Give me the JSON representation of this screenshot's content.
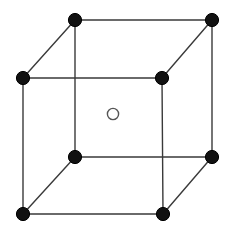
{
  "figure": {
    "canvas": {
      "width": 229,
      "height": 231,
      "background": "#ffffff"
    },
    "style": {
      "edge_color": "#3a3a3a",
      "edge_width": 1.4,
      "corner_atom_fill": "#111111",
      "corner_atom_stroke": "#111111",
      "corner_atom_radius": 6.6,
      "center_atom_fill": "#ffffff",
      "center_atom_stroke": "#555555",
      "center_atom_stroke_width": 1.4,
      "center_atom_radius": 5.6
    },
    "vertices": [
      {
        "name": "front-top-left",
        "label": "corner-atom-front-top-left",
        "x": 23,
        "y": 78,
        "kind": "corner"
      },
      {
        "name": "front-top-right",
        "label": "corner-atom-front-top-right",
        "x": 162,
        "y": 78,
        "kind": "corner"
      },
      {
        "name": "front-bottom-left",
        "label": "corner-atom-front-bottom-left",
        "x": 23,
        "y": 214,
        "kind": "corner"
      },
      {
        "name": "front-bottom-right",
        "label": "corner-atom-front-bottom-right",
        "x": 163,
        "y": 214,
        "kind": "corner"
      },
      {
        "name": "back-top-left",
        "label": "corner-atom-back-top-left",
        "x": 75,
        "y": 20,
        "kind": "corner"
      },
      {
        "name": "back-top-right",
        "label": "corner-atom-back-top-right",
        "x": 212,
        "y": 20,
        "kind": "corner"
      },
      {
        "name": "back-bottom-left",
        "label": "corner-atom-back-bottom-left",
        "x": 75,
        "y": 157,
        "kind": "corner"
      },
      {
        "name": "back-bottom-right",
        "label": "corner-atom-back-bottom-right",
        "x": 212,
        "y": 157,
        "kind": "corner"
      }
    ],
    "center_atom": {
      "name": "body-center",
      "label": "center-atom-body-center",
      "x": 113,
      "y": 114,
      "kind": "center"
    },
    "edges": [
      {
        "name": "edge-front-top",
        "x1": 23,
        "y1": 78,
        "x2": 162,
        "y2": 78
      },
      {
        "name": "edge-front-bottom",
        "x1": 23,
        "y1": 214,
        "x2": 163,
        "y2": 214
      },
      {
        "name": "edge-front-left",
        "x1": 23,
        "y1": 78,
        "x2": 23,
        "y2": 214
      },
      {
        "name": "edge-front-right",
        "x1": 162,
        "y1": 78,
        "x2": 163,
        "y2": 214
      },
      {
        "name": "edge-back-top",
        "x1": 75,
        "y1": 20,
        "x2": 212,
        "y2": 20
      },
      {
        "name": "edge-back-bottom",
        "x1": 75,
        "y1": 157,
        "x2": 212,
        "y2": 157
      },
      {
        "name": "edge-back-left",
        "x1": 75,
        "y1": 20,
        "x2": 75,
        "y2": 157
      },
      {
        "name": "edge-back-right",
        "x1": 212,
        "y1": 20,
        "x2": 212,
        "y2": 157
      },
      {
        "name": "edge-depth-top-left",
        "x1": 23,
        "y1": 78,
        "x2": 75,
        "y2": 20
      },
      {
        "name": "edge-depth-top-right",
        "x1": 162,
        "y1": 78,
        "x2": 212,
        "y2": 20
      },
      {
        "name": "edge-depth-bottom-left",
        "x1": 23,
        "y1": 214,
        "x2": 75,
        "y2": 157
      },
      {
        "name": "edge-depth-bottom-right",
        "x1": 163,
        "y1": 214,
        "x2": 212,
        "y2": 157
      }
    ]
  }
}
